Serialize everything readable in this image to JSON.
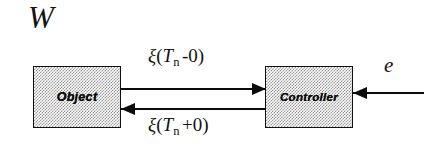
{
  "diagram": {
    "system_label": "W",
    "blocks": [
      {
        "id": "object",
        "label": "Object"
      },
      {
        "id": "controller",
        "label": "Controller"
      }
    ],
    "signals": {
      "forward": {
        "symbol": "ξ",
        "open_paren": "(",
        "variable": "T",
        "subscript": "n",
        "operator": "-0",
        "close_paren": ")",
        "full": "ξ(Tₙ -0)"
      },
      "feedback": {
        "symbol": "ξ",
        "open_paren": "(",
        "variable": "T",
        "subscript": "n",
        "operator": "+0",
        "close_paren": ")",
        "full": "ξ(Tₙ +0)"
      },
      "external_input": "e"
    },
    "colors": {
      "line": "#0b0b0b",
      "block_fill_dot": "#9a9a9a",
      "background": "#ffffff",
      "text": "#121212"
    }
  }
}
